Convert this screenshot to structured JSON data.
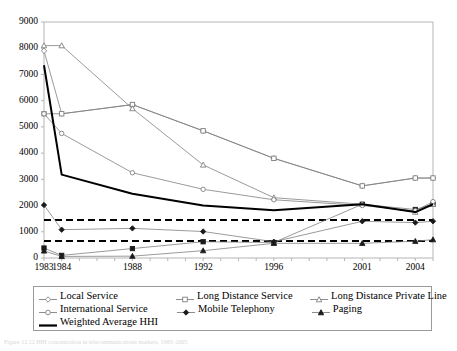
{
  "chart_data": {
    "type": "line",
    "title": "",
    "subtitle": "",
    "xlabel": "",
    "ylabel": "",
    "xlim": [
      1983,
      2005
    ],
    "ylim": [
      0,
      9000
    ],
    "ytick_step": 1000,
    "yticks": [
      0,
      1000,
      2000,
      3000,
      4000,
      5000,
      6000,
      7000,
      8000,
      9000
    ],
    "ytick_labels": [
      "0",
      "1000",
      "2000",
      "3000",
      "4000",
      "5000",
      "6000",
      "7000",
      "8000",
      "9000"
    ],
    "x": [
      1983,
      1984,
      1988,
      1992,
      1996,
      2001,
      2004,
      2005
    ],
    "xticks": [
      1983,
      1984,
      1985,
      1986,
      1987,
      1988,
      1989,
      1990,
      1991,
      1992,
      1993,
      1994,
      1995,
      1996,
      1997,
      1998,
      1999,
      2000,
      2001,
      2002,
      2003,
      2004,
      2005
    ],
    "xtick_labels_shown": [
      "1983",
      "1984",
      "1988",
      "1992",
      "1996",
      "2001",
      "2004"
    ],
    "grid": false,
    "legend_position": "below-plot",
    "series": [
      {
        "name": "Local Service",
        "marker": "diamond",
        "values": [
          7900,
          5500,
          5850,
          4850,
          3800,
          2750,
          3050,
          3050
        ]
      },
      {
        "name": "Long Distance Service",
        "marker": "square",
        "values": [
          5500,
          5500,
          5850,
          4850,
          3800,
          2750,
          3050,
          3050
        ]
      },
      {
        "name": "Long Distance Private Line",
        "marker": "triangle",
        "values": [
          8100,
          8100,
          5700,
          3550,
          2300,
          2050,
          1750,
          2050
        ]
      },
      {
        "name": "International Service",
        "marker": "circle",
        "values": [
          5500,
          4750,
          3250,
          2620,
          2220,
          2000,
          1800,
          2150
        ]
      },
      {
        "name": "Mobile Telephony",
        "marker": "filled-diamond",
        "values": [
          2020,
          1080,
          1130,
          1010,
          620,
          1400,
          1350,
          1400
        ]
      },
      {
        "name": "Paging",
        "marker": "filled-triangle",
        "values": [
          270,
          60,
          70,
          280,
          560,
          560,
          640,
          700
        ]
      },
      {
        "name": "Weighted Average HHI",
        "marker": "none",
        "values": [
          7350,
          3180,
          2450,
          2000,
          1820,
          2050,
          1750,
          2050
        ]
      }
    ],
    "extra_series": [
      {
        "name": "second-line-squares",
        "marker": "filled-square",
        "values": [
          380,
          100,
          360,
          620,
          590,
          2050,
          1850,
          2050
        ]
      }
    ],
    "reference_lines": [
      {
        "name": "upper-threshold",
        "value": 1450,
        "style": "dashed"
      },
      {
        "name": "lower-threshold",
        "value": 650,
        "style": "dashed"
      }
    ]
  },
  "legend": {
    "rows": [
      [
        {
          "label": "Local Service",
          "marker": "diamond"
        },
        {
          "label": "Long Distance Service",
          "marker": "square"
        },
        {
          "label": "Long Distance Private Line",
          "marker": "triangle"
        }
      ],
      [
        {
          "label": "International Service",
          "marker": "circle"
        },
        {
          "label": "Mobile Telephony",
          "marker": "filled-diamond"
        },
        {
          "label": "Paging",
          "marker": "filled-triangle"
        }
      ],
      [
        {
          "label": "Weighted Average HHI",
          "marker": "thick-line"
        }
      ]
    ]
  },
  "caption": {
    "text": "Figure 12.12  HHI concentration in telecommunications markets, 1983–2005"
  },
  "colors": {
    "series_line": "#808080",
    "emphasis_line": "#000000",
    "axis": "#b5b5b5",
    "text": "#000000",
    "caption": "#d8d8d8"
  }
}
